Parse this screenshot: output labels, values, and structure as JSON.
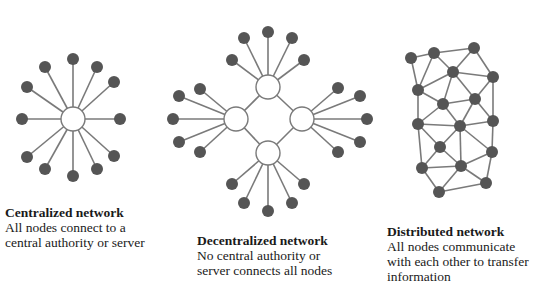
{
  "colors": {
    "background": "#ffffff",
    "node_fill": "#555555",
    "edge_stroke": "#7a7a7a",
    "hub_fill": "#ffffff",
    "hub_stroke": "#7a7a7a",
    "text": "#1a1a1a"
  },
  "panels": [
    {
      "id": "centralized",
      "title": "Centralized network",
      "description_lines": [
        "All nodes connect to a",
        "central authority or server"
      ],
      "hubs": [
        [
          73,
          119
        ]
      ],
      "leaves": [
        {
          "hub": 0,
          "pos": [
            73,
            59
          ]
        },
        {
          "hub": 0,
          "pos": [
            45,
            67
          ]
        },
        {
          "hub": 0,
          "pos": [
            97,
            67
          ]
        },
        {
          "hub": 0,
          "pos": [
            27,
            87
          ]
        },
        {
          "hub": 0,
          "pos": [
            114,
            82
          ]
        },
        {
          "hub": 0,
          "pos": [
            22,
            119
          ]
        },
        {
          "hub": 0,
          "pos": [
            120,
            119
          ]
        },
        {
          "hub": 0,
          "pos": [
            27,
            157
          ]
        },
        {
          "hub": 0,
          "pos": [
            114,
            156
          ]
        },
        {
          "hub": 0,
          "pos": [
            45,
            169
          ]
        },
        {
          "hub": 0,
          "pos": [
            97,
            169
          ]
        },
        {
          "hub": 0,
          "pos": [
            73,
            176
          ]
        }
      ]
    },
    {
      "id": "decentralized",
      "title": "Decentralized network",
      "description_lines": [
        "No central authority or",
        "server connects all nodes"
      ],
      "hubs": [
        [
          268,
          87
        ],
        [
          236,
          119
        ],
        [
          302,
          119
        ],
        [
          268,
          153
        ]
      ],
      "hub_links": [
        [
          0,
          1
        ],
        [
          0,
          2
        ],
        [
          1,
          3
        ],
        [
          2,
          3
        ]
      ],
      "leaves": [
        {
          "hub": 0,
          "pos": [
            268,
            32
          ]
        },
        {
          "hub": 0,
          "pos": [
            244,
            38
          ]
        },
        {
          "hub": 0,
          "pos": [
            292,
            38
          ]
        },
        {
          "hub": 0,
          "pos": [
            232,
            60
          ]
        },
        {
          "hub": 0,
          "pos": [
            304,
            60
          ]
        },
        {
          "hub": 1,
          "pos": [
            200,
            89
          ]
        },
        {
          "hub": 1,
          "pos": [
            179,
            96
          ]
        },
        {
          "hub": 1,
          "pos": [
            173,
            119
          ]
        },
        {
          "hub": 1,
          "pos": [
            179,
            142
          ]
        },
        {
          "hub": 1,
          "pos": [
            200,
            152
          ]
        },
        {
          "hub": 2,
          "pos": [
            338,
            88
          ]
        },
        {
          "hub": 2,
          "pos": [
            360,
            96
          ]
        },
        {
          "hub": 2,
          "pos": [
            367,
            119
          ]
        },
        {
          "hub": 2,
          "pos": [
            360,
            142
          ]
        },
        {
          "hub": 2,
          "pos": [
            338,
            152
          ]
        },
        {
          "hub": 3,
          "pos": [
            232,
            184
          ]
        },
        {
          "hub": 3,
          "pos": [
            244,
            203
          ]
        },
        {
          "hub": 3,
          "pos": [
            268,
            211
          ]
        },
        {
          "hub": 3,
          "pos": [
            292,
            203
          ]
        },
        {
          "hub": 3,
          "pos": [
            304,
            184
          ]
        }
      ]
    },
    {
      "id": "distributed",
      "title": "Distributed network",
      "description_lines": [
        "All nodes communicate",
        "with each other to transfer",
        "information"
      ],
      "nodes": [
        [
          411,
          58
        ],
        [
          434,
          53
        ],
        [
          474,
          48
        ],
        [
          453,
          72
        ],
        [
          493,
          77
        ],
        [
          418,
          90
        ],
        [
          443,
          104
        ],
        [
          475,
          99
        ],
        [
          418,
          124
        ],
        [
          460,
          126
        ],
        [
          493,
          121
        ],
        [
          440,
          147
        ],
        [
          492,
          152
        ],
        [
          422,
          168
        ],
        [
          461,
          166
        ],
        [
          486,
          183
        ],
        [
          439,
          192
        ]
      ],
      "edges": [
        [
          0,
          1
        ],
        [
          0,
          5
        ],
        [
          1,
          2
        ],
        [
          1,
          3
        ],
        [
          1,
          5
        ],
        [
          2,
          3
        ],
        [
          2,
          4
        ],
        [
          3,
          4
        ],
        [
          3,
          5
        ],
        [
          3,
          6
        ],
        [
          3,
          7
        ],
        [
          4,
          7
        ],
        [
          4,
          10
        ],
        [
          5,
          6
        ],
        [
          5,
          8
        ],
        [
          6,
          7
        ],
        [
          6,
          8
        ],
        [
          6,
          9
        ],
        [
          7,
          9
        ],
        [
          7,
          10
        ],
        [
          8,
          9
        ],
        [
          8,
          11
        ],
        [
          8,
          13
        ],
        [
          9,
          10
        ],
        [
          9,
          11
        ],
        [
          9,
          12
        ],
        [
          9,
          14
        ],
        [
          10,
          12
        ],
        [
          11,
          13
        ],
        [
          11,
          14
        ],
        [
          12,
          14
        ],
        [
          12,
          15
        ],
        [
          13,
          14
        ],
        [
          13,
          16
        ],
        [
          14,
          16
        ],
        [
          14,
          15
        ],
        [
          15,
          16
        ]
      ]
    }
  ]
}
